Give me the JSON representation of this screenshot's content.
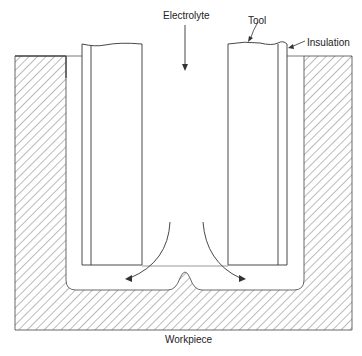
{
  "diagram": {
    "labels": {
      "electrolyte": "Electrolyte",
      "tool": "Tool",
      "insulation": "Insulation",
      "workpiece": "Workpiece"
    },
    "colors": {
      "line": "#333333",
      "hatch": "#555555",
      "background": "#ffffff"
    }
  }
}
